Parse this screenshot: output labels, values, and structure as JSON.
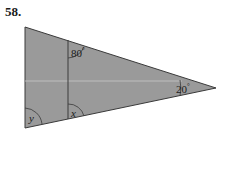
{
  "problem": {
    "number": "58."
  },
  "figure": {
    "type": "triangle-with-segment",
    "colors": {
      "fill": "#9a9a9a",
      "stroke": "#3a3a3a",
      "highlight_line": "#c8c8c8",
      "text": "#1a1a1a"
    },
    "vertices": {
      "top_left": [
        25,
        27
      ],
      "bottom_left": [
        25,
        128
      ],
      "right": [
        216,
        88
      ]
    },
    "inner_segment": {
      "top": [
        68,
        40
      ],
      "bottom": [
        68,
        119
      ]
    },
    "angles": [
      {
        "id": "top-inner",
        "label": "80",
        "degree_mark": "°",
        "position": "top of inner segment"
      },
      {
        "id": "right-vertex",
        "label": "20",
        "degree_mark": "°",
        "position": "right vertex"
      },
      {
        "id": "bottom-inner",
        "label": "x",
        "degree_mark": "",
        "position": "bottom of inner segment"
      },
      {
        "id": "bottom-left",
        "label": "y",
        "degree_mark": "",
        "position": "bottom-left vertex"
      }
    ]
  }
}
